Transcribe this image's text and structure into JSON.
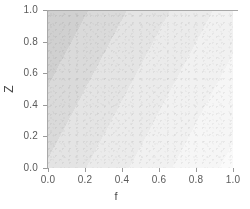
{
  "chart_data": {
    "type": "heatmap",
    "title": "",
    "subtitle": "",
    "xlabel": "f",
    "ylabel": "Z",
    "xlim": [
      0.0,
      1.0
    ],
    "ylim": [
      0.0,
      1.0
    ],
    "xticks": [
      "0.0",
      "0.2",
      "0.4",
      "0.6",
      "0.8",
      "1.0"
    ],
    "xtick_values": [
      0.0,
      0.2,
      0.4,
      0.6,
      0.8,
      1.0
    ],
    "yticks": [
      "0.0",
      "0.2",
      "0.4",
      "0.6",
      "0.8",
      "1.0"
    ],
    "ytick_values": [
      0.0,
      0.2,
      0.4,
      0.6,
      0.8,
      1.0
    ],
    "grid": false,
    "legend": "none",
    "colormap": "grayscale-reversed",
    "band_axis": "value decreases along increasing f + 0.55*Z",
    "bands": [
      {
        "level": 1,
        "stop_start_pct": 0,
        "stop_end_pct": 10,
        "color": "#b6b6b6",
        "approx_value": 1.0
      },
      {
        "level": 2,
        "stop_start_pct": 10,
        "stop_end_pct": 19,
        "color": "#c4c4c4",
        "approx_value": 0.86
      },
      {
        "level": 3,
        "stop_start_pct": 19,
        "stop_end_pct": 28,
        "color": "#d0d0d0",
        "approx_value": 0.72
      },
      {
        "level": 4,
        "stop_start_pct": 28,
        "stop_end_pct": 37,
        "color": "#dadada",
        "approx_value": 0.58
      },
      {
        "level": 5,
        "stop_start_pct": 37,
        "stop_end_pct": 47,
        "color": "#e4e4e4",
        "approx_value": 0.44
      },
      {
        "level": 6,
        "stop_start_pct": 47,
        "stop_end_pct": 57,
        "color": "#ebebeb",
        "approx_value": 0.33
      },
      {
        "level": 7,
        "stop_start_pct": 57,
        "stop_end_pct": 67,
        "color": "#f1f1f1",
        "approx_value": 0.23
      },
      {
        "level": 8,
        "stop_start_pct": 67,
        "stop_end_pct": 78,
        "color": "#f6f6f6",
        "approx_value": 0.14
      },
      {
        "level": 9,
        "stop_start_pct": 78,
        "stop_end_pct": 88,
        "color": "#fafafa",
        "approx_value": 0.07
      },
      {
        "level": 10,
        "stop_start_pct": 88,
        "stop_end_pct": 100,
        "color": "#ffffff",
        "approx_value": 0.0
      }
    ],
    "gradient_angle_deg": 118,
    "axis_color": "#a8a8a8",
    "tick_color": "#9a9a9a",
    "text_color": "#5a5a5a"
  },
  "figure": {
    "background": "#ffffff"
  }
}
